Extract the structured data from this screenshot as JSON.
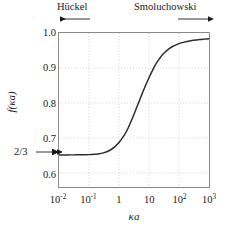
{
  "figure": {
    "background_color": "#ffffff",
    "frame_color": "#8a8a8a",
    "grid_color": "#c9c9c9",
    "curve_color": "#2b2b2b",
    "text_color": "#1a1a1a"
  },
  "annotations": {
    "huckel_label": "Hückel",
    "smoluchowski_label": "Smoluchowski",
    "plateau_label": "2/3",
    "huckel_arrow_direction": "left",
    "smoluchowski_arrow_direction": "right",
    "plateau_arrow_direction": "right"
  },
  "axes": {
    "xlabel": "κa",
    "ylabel": "f(κa)",
    "x_ticklabels": [
      "10",
      "10",
      "1",
      "10",
      "10",
      "10"
    ],
    "x_exponents": [
      "-2",
      "-1",
      "",
      "1",
      "2",
      "3"
    ],
    "y_ticklabels": [
      "1.0",
      "0.9",
      "0.8",
      "0.7",
      "0.6"
    ]
  },
  "chart_data": {
    "type": "line",
    "title": "",
    "subtitle": "",
    "xlabel": "κa",
    "ylabel": "f(κa)",
    "xscale": "log",
    "yscale": "linear",
    "xlim": [
      0.01,
      1000
    ],
    "ylim": [
      0.575,
      1.015
    ],
    "grid": true,
    "legend": null,
    "xticks": [
      0.01,
      0.1,
      1,
      10,
      100,
      1000
    ],
    "xticklabels": [
      "10^-2",
      "10^-1",
      "1",
      "10",
      "10^2",
      "10^3"
    ],
    "yticks": [
      1.0,
      0.9,
      0.8,
      0.7,
      0.6
    ],
    "yticklabels": [
      "1.0",
      "0.9",
      "0.8",
      "0.7",
      "0.6"
    ],
    "annotations": [
      {
        "text": "Hückel",
        "position": "top-left",
        "arrow": "left",
        "value": 0.667
      },
      {
        "text": "Smoluchowski",
        "position": "top-right",
        "arrow": "right",
        "value": 1.0
      },
      {
        "text": "2/3",
        "position": "left-axis",
        "arrow": "right",
        "value": 0.667
      }
    ],
    "series": [
      {
        "name": "Henry's function f(κa)",
        "x": [
          0.01,
          0.02,
          0.03,
          0.05,
          0.07,
          0.1,
          0.15,
          0.2,
          0.3,
          0.5,
          0.7,
          1.0,
          1.5,
          2.0,
          3.0,
          4.0,
          5.0,
          7.0,
          10.0,
          15.0,
          20.0,
          30.0,
          50.0,
          70.0,
          100.0,
          150.0,
          200.0,
          300.0,
          500.0,
          700.0,
          1000.0
        ],
        "y": [
          0.6667,
          0.6667,
          0.6668,
          0.6669,
          0.6671,
          0.6675,
          0.6684,
          0.6695,
          0.6724,
          0.68,
          0.689,
          0.702,
          0.723,
          0.743,
          0.778,
          0.805,
          0.826,
          0.857,
          0.887,
          0.918,
          0.936,
          0.956,
          0.972,
          0.979,
          0.9845,
          0.989,
          0.9915,
          0.9942,
          0.9965,
          0.9975,
          0.9985
        ]
      }
    ]
  }
}
